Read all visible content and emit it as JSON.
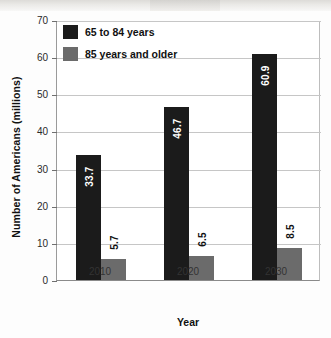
{
  "chart_data": {
    "type": "bar",
    "title": "",
    "subtitle": "",
    "xlabel": "Year",
    "ylabel": "Number of Americans (millions)",
    "categories": [
      "2010",
      "2020",
      "2030"
    ],
    "series": [
      {
        "name": "65 to 84 years",
        "color": "#1b1b1b",
        "values": [
          33.7,
          46.7,
          60.9
        ],
        "value_labels": [
          "33.7",
          "46.7",
          "60.9"
        ],
        "label_position": "inside",
        "label_color": "#ffffff"
      },
      {
        "name": "85 years and older",
        "color": "#6b6b6b",
        "values": [
          5.7,
          6.5,
          8.5
        ],
        "value_labels": [
          "5.7",
          "6.5",
          "8.5"
        ],
        "label_position": "outside",
        "label_color": "#111111"
      }
    ],
    "ylim": [
      0,
      70
    ],
    "ytick_values": [
      0,
      10,
      20,
      30,
      40,
      50,
      60,
      70
    ],
    "ytick_labels": [
      "0",
      "10",
      "20",
      "30",
      "40",
      "50",
      "60",
      "70"
    ],
    "grid": true,
    "grid_axis": "y",
    "legend_position": "top-left-inside",
    "bar_orientation": "vertical",
    "bars_touch_within_group": true
  },
  "axes": {
    "y_title": "Number of Americans (millions)",
    "x_title": "Year"
  },
  "legend": {
    "entries": [
      {
        "label": "65 to 84 years",
        "swatch": "#1b1b1b"
      },
      {
        "label": "85 years and older",
        "swatch": "#6b6b6b"
      }
    ]
  }
}
